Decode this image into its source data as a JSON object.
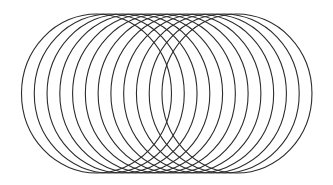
{
  "figure": {
    "width": 333,
    "height": 185,
    "background": "#ffffff",
    "stroke_color": "#2b2b2b",
    "stroke_width": 1.1,
    "shape": "ellipse",
    "count": 12,
    "first_cx": 96.5,
    "spacing_x": 12.77,
    "cy": 93.5,
    "rx": 75,
    "ry": 79.5
  }
}
